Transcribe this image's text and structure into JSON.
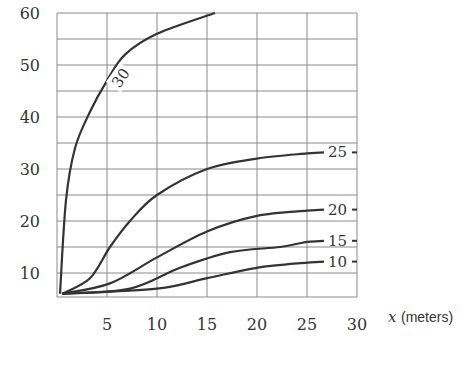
{
  "chart_data": {
    "type": "line",
    "title": "",
    "xlabel_var": "x",
    "xlabel_unit": "(meters)",
    "ylabel": "",
    "xlim": [
      0,
      30
    ],
    "ylim": [
      5,
      60
    ],
    "grid": true,
    "x_ticks": [
      "5",
      "10",
      "15",
      "20",
      "25",
      "30"
    ],
    "y_ticks": [
      "10",
      "20",
      "30",
      "40",
      "50",
      "60"
    ],
    "series": [
      {
        "name": "30",
        "x": [
          0.3,
          0.9,
          1.8,
          3.3,
          5,
          6.8,
          10,
          15.8
        ],
        "y": [
          6,
          24,
          34,
          41,
          47,
          52,
          56,
          60
        ]
      },
      {
        "name": "25",
        "x": [
          0.5,
          3.3,
          5.3,
          7.3,
          10,
          15,
          20,
          25
        ],
        "y": [
          6,
          9,
          15,
          20,
          25,
          30,
          32,
          33
        ]
      },
      {
        "name": "20",
        "x": [
          0.5,
          5.3,
          10,
          15,
          20,
          25
        ],
        "y": [
          6,
          8,
          13,
          18,
          21,
          22
        ]
      },
      {
        "name": "15",
        "x": [
          0.5,
          7.3,
          12.3,
          17.3,
          22.3,
          25
        ],
        "y": [
          6,
          7,
          11,
          14,
          15,
          16
        ]
      },
      {
        "name": "10",
        "x": [
          0.5,
          10,
          15,
          20,
          25
        ],
        "y": [
          6,
          7,
          9,
          11,
          12
        ]
      }
    ],
    "curve_labels": [
      "30",
      "25",
      "20",
      "15",
      "10"
    ]
  }
}
